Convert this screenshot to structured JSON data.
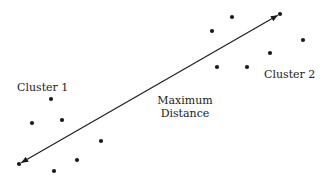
{
  "labels": {
    "cluster1": "Cluster 1",
    "cluster2": "Cluster 2",
    "max_line1": "Maximum",
    "max_line2": "Distance"
  },
  "colors": {
    "ink": "#1a1a1a",
    "text": "#222222",
    "background": "#ffffff"
  },
  "cluster1_points": [
    [
      51,
      99
    ],
    [
      32,
      123
    ],
    [
      62,
      120
    ],
    [
      101,
      141
    ],
    [
      77,
      160
    ],
    [
      54,
      171
    ],
    [
      19,
      164
    ]
  ],
  "cluster2_points": [
    [
      212,
      31
    ],
    [
      232,
      17
    ],
    [
      280,
      14
    ],
    [
      303,
      40
    ],
    [
      270,
      53
    ],
    [
      217,
      67
    ],
    [
      247,
      67
    ]
  ],
  "arrow": {
    "from": [
      19,
      164
    ],
    "to": [
      280,
      14
    ],
    "style": "double-headed"
  }
}
